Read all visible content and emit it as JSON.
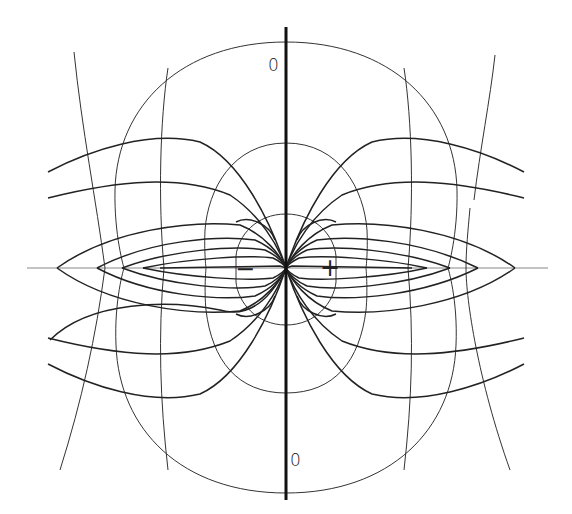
{
  "diagram": {
    "colors": {
      "line": "#222222",
      "thin_line": "#333333",
      "background": "#ffffff"
    },
    "center": {
      "x": 286,
      "y": 268
    },
    "labels": {
      "zero_top": "0",
      "zero_bottom": "0",
      "negative": "−",
      "positive": "+"
    },
    "axes": {
      "vertical": {
        "x": 286,
        "y1": 27,
        "y2": 500
      },
      "horizontal": {
        "y": 268,
        "x1": 27,
        "x2": 548
      }
    },
    "convergence_points_left": [
      57,
      97,
      122,
      143
    ],
    "convergence_points_right": [
      427,
      450,
      478,
      515
    ]
  }
}
